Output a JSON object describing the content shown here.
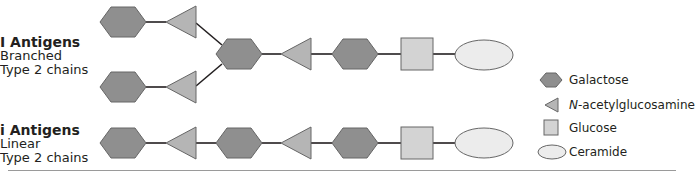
{
  "groups": [
    {
      "title": "I Antigens",
      "line1": "Branched",
      "line2": "Type 2 chains"
    },
    {
      "title": "i Antigens",
      "line1": "Linear",
      "line2": "Type 2 chains"
    }
  ],
  "legend": {
    "galactose": "Galactose",
    "nacetyl_prefix": "N",
    "nacetyl_rest": "-acetylglucosamine",
    "glucose": "Glucose",
    "ceramide": "Ceramide"
  },
  "colors": {
    "galactose": "#8f8f8f",
    "nacetylglucosamine": "#b5b5b5",
    "glucose": "#d3d3d3",
    "ceramide": "#ececec",
    "stroke": "#555555",
    "line": "#231f20"
  }
}
